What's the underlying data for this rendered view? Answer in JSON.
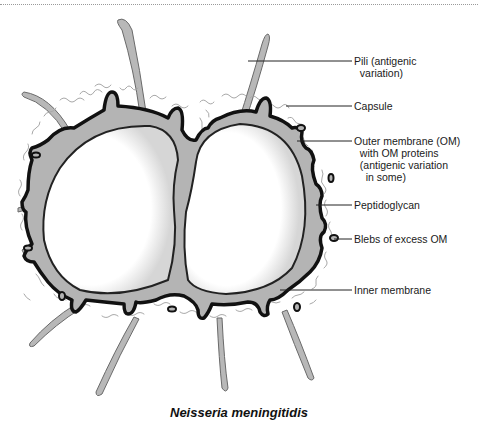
{
  "diagram": {
    "title": "Neisseria meningitidis",
    "labels": [
      {
        "id": "pili",
        "text": "Pili (antigenic\n  variation)",
        "x": 354,
        "y": 56,
        "line": {
          "x1": 248,
          "y1": 61,
          "x2": 352,
          "y2": 61
        }
      },
      {
        "id": "capsule",
        "text": "Capsule",
        "x": 354,
        "y": 101,
        "line": {
          "x1": 286,
          "y1": 106,
          "x2": 352,
          "y2": 106
        }
      },
      {
        "id": "outer-membrane",
        "text": "Outer membrane (OM)\n  with OM proteins\n  (antigenic variation\n    in some)",
        "x": 354,
        "y": 136,
        "line": {
          "x1": 297,
          "y1": 141,
          "x2": 352,
          "y2": 141
        }
      },
      {
        "id": "peptidoglycan",
        "text": "Peptidoglycan",
        "x": 354,
        "y": 200,
        "line": {
          "x1": 316,
          "y1": 205,
          "x2": 352,
          "y2": 205
        }
      },
      {
        "id": "blebs",
        "text": "Blebs of excess OM",
        "x": 354,
        "y": 234,
        "line": {
          "x1": 334,
          "y1": 239,
          "x2": 352,
          "y2": 239
        }
      },
      {
        "id": "inner-membrane",
        "text": "Inner membrane",
        "x": 354,
        "y": 285,
        "line": {
          "x1": 280,
          "y1": 290,
          "x2": 352,
          "y2": 290
        }
      }
    ],
    "colors": {
      "outer_membrane": "#111111",
      "peptidoglycan": "#b4b4b4",
      "cytoplasm": "#ffffff",
      "capsule": "#a8a8a8",
      "pili_fill": "#b8b8b8",
      "pili_stroke": "#666666"
    }
  }
}
